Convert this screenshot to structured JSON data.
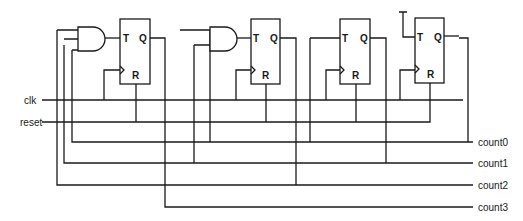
{
  "diagram": {
    "type": "4-bit synchronous counter (T flip-flops with AND gates)",
    "inputs": [
      {
        "label": "clk"
      },
      {
        "label": "reset"
      }
    ],
    "outputs": [
      {
        "label": "count0"
      },
      {
        "label": "count1"
      },
      {
        "label": "count2"
      },
      {
        "label": "count3"
      }
    ],
    "flipflop_pins": {
      "t": "T",
      "q": "Q",
      "r": "R"
    },
    "flipflops": [
      {
        "id": "ff3",
        "output": "count3"
      },
      {
        "id": "ff2",
        "output": "count2"
      },
      {
        "id": "ff1",
        "output": "count1"
      },
      {
        "id": "ff0",
        "output": "count0"
      }
    ],
    "colors": {
      "wire": "#1a1a1a",
      "background": "#ffffff"
    }
  }
}
